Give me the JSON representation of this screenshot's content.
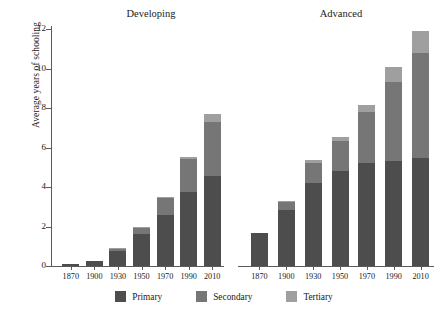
{
  "chart_data": {
    "type": "bar",
    "title": "",
    "subtitle": "",
    "stacked": true,
    "xlabel": "",
    "ylabel": "Average years of schooling",
    "ylim": [
      0,
      12
    ],
    "yticks": [
      0,
      2,
      4,
      6,
      8,
      10,
      12
    ],
    "grid": false,
    "legend_position": "bottom",
    "legend": [
      "Primary",
      "Secondary",
      "Tertiary"
    ],
    "categories": [
      "1870",
      "1900",
      "1930",
      "1950",
      "1970",
      "1990",
      "2010"
    ],
    "panels": [
      {
        "name": "Developing",
        "series": [
          {
            "name": "Primary",
            "values": [
              0.08,
              0.25,
              0.78,
              1.6,
              2.6,
              3.75,
              4.55
            ]
          },
          {
            "name": "Secondary",
            "values": [
              0.0,
              0.0,
              0.1,
              0.38,
              0.85,
              1.65,
              2.75
            ]
          },
          {
            "name": "Tertiary",
            "values": [
              0.0,
              0.0,
              0.02,
              0.02,
              0.05,
              0.1,
              0.38
            ]
          }
        ],
        "totals": [
          0.08,
          0.25,
          0.9,
          2.0,
          3.5,
          5.5,
          7.68
        ]
      },
      {
        "name": "Advanced",
        "series": [
          {
            "name": "Primary",
            "values": [
              1.65,
              2.85,
              4.2,
              4.8,
              5.2,
              5.3,
              5.45
            ]
          },
          {
            "name": "Secondary",
            "values": [
              0.0,
              0.4,
              1.0,
              1.55,
              2.6,
              4.0,
              5.35
            ]
          },
          {
            "name": "Tertiary",
            "values": [
              0.0,
              0.05,
              0.15,
              0.2,
              0.35,
              0.8,
              1.1
            ]
          }
        ],
        "totals": [
          1.65,
          3.3,
          5.35,
          6.55,
          8.15,
          10.1,
          11.9
        ]
      }
    ],
    "colors": {
      "Primary": "#4d4d4d",
      "Secondary": "#767676",
      "Tertiary": "#9f9f9f",
      "axis": "#5a5a5a",
      "text": "#1a1a1a",
      "background": "#ffffff"
    }
  }
}
